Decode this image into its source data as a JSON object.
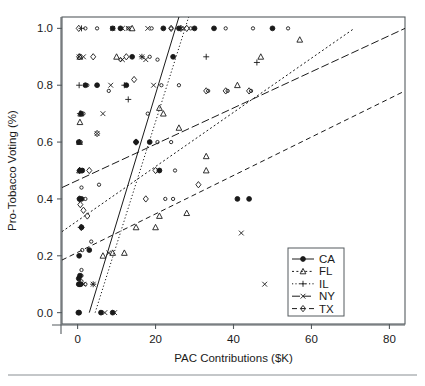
{
  "chart_data": {
    "type": "scatter",
    "title": "",
    "xlabel": "PAC Contributions ($K)",
    "ylabel": "Pro-Tobacco Voting (%)",
    "xlim": [
      -4,
      84
    ],
    "ylim": [
      -0.04,
      1.04
    ],
    "xticks": [
      0,
      20,
      40,
      60,
      80
    ],
    "xtick_labels": [
      "0",
      "20",
      "40",
      "60",
      "80"
    ],
    "yticks": [
      0.0,
      0.2,
      0.4,
      0.6,
      0.8,
      1.0
    ],
    "ytick_labels": [
      "0.0",
      "0.2",
      "0.4",
      "0.6",
      "0.8",
      "1.0"
    ],
    "grid": false,
    "legend_position": "bottom-right",
    "legend_entries": [
      {
        "label": "CA",
        "marker": "filled-circle",
        "linestyle": "solid"
      },
      {
        "label": "FL",
        "marker": "triangle",
        "linestyle": "dashed"
      },
      {
        "label": "IL",
        "marker": "plus",
        "linestyle": "dotted"
      },
      {
        "label": "NY",
        "marker": "x",
        "linestyle": "dash-dot"
      },
      {
        "label": "TX",
        "marker": "diamond",
        "linestyle": "long-dash"
      }
    ],
    "series": [
      {
        "name": "CA",
        "marker": "filled-circle",
        "linestyle": "solid",
        "fit_line": {
          "x0": 3.0,
          "y0": 0.0,
          "x1": 26.0,
          "y1": 1.04
        },
        "points": [
          [
            0.2,
            0.0
          ],
          [
            0.4,
            0.0
          ],
          [
            0.3,
            0.1
          ],
          [
            0.5,
            0.1
          ],
          [
            0.8,
            0.1
          ],
          [
            0.3,
            0.12
          ],
          [
            0.6,
            0.13
          ],
          [
            0.4,
            0.2
          ],
          [
            1.0,
            0.4
          ],
          [
            0.5,
            0.4
          ],
          [
            0.6,
            0.5
          ],
          [
            1.2,
            0.5
          ],
          [
            0.3,
            0.6
          ],
          [
            0.9,
            0.7
          ],
          [
            2.0,
            0.8
          ],
          [
            5.0,
            0.8
          ],
          [
            12.5,
            0.8
          ],
          [
            14.0,
            0.9
          ],
          [
            15.0,
            0.6
          ],
          [
            18.5,
            0.6
          ],
          [
            21.0,
            0.5
          ],
          [
            24.5,
            0.9
          ],
          [
            30.0,
            1.0
          ],
          [
            9.0,
            1.0
          ],
          [
            11.0,
            1.0
          ],
          [
            22.0,
            1.0
          ],
          [
            26.0,
            1.0
          ],
          [
            35.0,
            1.0
          ],
          [
            50.0,
            1.0
          ],
          [
            41.0,
            0.4
          ],
          [
            44.0,
            0.4
          ],
          [
            6.0,
            0.0
          ],
          [
            9.0,
            0.0
          ],
          [
            3.0,
            0.22
          ],
          [
            1.0,
            0.3
          ]
        ]
      },
      {
        "name": "FL",
        "marker": "triangle",
        "linestyle": "dashed",
        "fit_line": {
          "x0": -4.0,
          "y0": 0.285,
          "x1": 71.0,
          "y1": 1.0
        },
        "points": [
          [
            0.5,
            0.5
          ],
          [
            0.5,
            0.6
          ],
          [
            0.6,
            0.67
          ],
          [
            0.8,
            0.7
          ],
          [
            0.6,
            0.9
          ],
          [
            10.0,
            0.9
          ],
          [
            14.0,
            1.0
          ],
          [
            21.0,
            0.72
          ],
          [
            22.0,
            0.7
          ],
          [
            26.0,
            0.65
          ],
          [
            33.0,
            0.55
          ],
          [
            28.0,
            0.35
          ],
          [
            21.0,
            0.34
          ],
          [
            15.0,
            0.3
          ],
          [
            9.0,
            0.21
          ],
          [
            12.0,
            0.21
          ],
          [
            6.5,
            0.2
          ],
          [
            41.0,
            0.8
          ],
          [
            47.0,
            0.9
          ],
          [
            57.0,
            0.96
          ],
          [
            33.0,
            0.5
          ],
          [
            20.0,
            0.3
          ]
        ]
      },
      {
        "name": "IL",
        "marker": "plus",
        "linestyle": "dotted",
        "fit_line": {
          "x0": 4.5,
          "y0": 0.0,
          "x1": 28.5,
          "y1": 1.04
        },
        "points": [
          [
            0.4,
            0.8
          ],
          [
            1.0,
            1.0
          ],
          [
            0.6,
            0.7
          ],
          [
            12.0,
            0.8
          ],
          [
            13.0,
            0.75
          ],
          [
            0.8,
            0.3
          ],
          [
            4.0,
            0.1
          ],
          [
            33.0,
            0.9
          ],
          [
            46.0,
            0.88
          ],
          [
            16.5,
            0.9
          ]
        ]
      },
      {
        "name": "NY",
        "marker": "x",
        "linestyle": "dash-dot",
        "fit_line": {
          "x0": -4.0,
          "y0": 0.44,
          "x1": 84.0,
          "y1": 1.0
        },
        "points": [
          [
            0.4,
            0.9
          ],
          [
            1.5,
            0.9
          ],
          [
            6.5,
            0.7
          ],
          [
            5.0,
            0.63
          ],
          [
            8.5,
            0.8
          ],
          [
            16.5,
            0.9
          ],
          [
            17.5,
            0.89
          ],
          [
            19.5,
            0.8
          ],
          [
            9.0,
            1.0
          ],
          [
            11.5,
            1.0
          ],
          [
            13.0,
            1.0
          ],
          [
            18.0,
            1.0
          ],
          [
            8.0,
            0.21
          ],
          [
            1.5,
            0.1
          ],
          [
            4.0,
            0.1
          ],
          [
            7.0,
            0.0
          ],
          [
            9.5,
            0.0
          ],
          [
            42.0,
            0.28
          ],
          [
            48.0,
            0.1
          ],
          [
            11.5,
            0.89
          ]
        ]
      },
      {
        "name": "TX",
        "marker": "diamond",
        "linestyle": "long-dash",
        "fit_line": {
          "x0": -4.0,
          "y0": 0.185,
          "x1": 84.0,
          "y1": 0.78
        },
        "points": [
          [
            0.3,
            1.0
          ],
          [
            24.0,
            1.0
          ],
          [
            26.5,
            1.0
          ],
          [
            28.0,
            1.0
          ],
          [
            0.4,
            0.9
          ],
          [
            4.0,
            0.9
          ],
          [
            14.5,
            0.82
          ],
          [
            15.0,
            0.6
          ],
          [
            0.5,
            0.5
          ],
          [
            3.0,
            0.5
          ],
          [
            0.5,
            0.4
          ],
          [
            0.7,
            0.38
          ],
          [
            1.5,
            0.36
          ],
          [
            2.5,
            0.34
          ],
          [
            1.0,
            0.3
          ],
          [
            5.0,
            0.63
          ],
          [
            20.0,
            0.5
          ],
          [
            33.0,
            0.78
          ],
          [
            38.0,
            0.78
          ],
          [
            44.0,
            0.78
          ],
          [
            17.5,
            0.4
          ],
          [
            31.0,
            0.45
          ],
          [
            12.5,
            0.9
          ]
        ]
      }
    ]
  }
}
